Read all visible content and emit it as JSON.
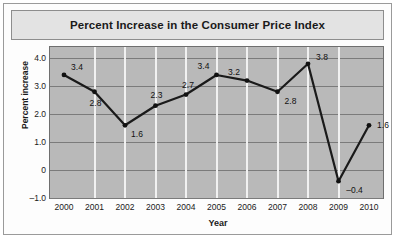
{
  "chart_data": {
    "type": "line",
    "title": "Percent Increase in the Consumer Price Index",
    "xlabel": "Year",
    "ylabel": "Percent increase",
    "categories": [
      "2000",
      "2001",
      "2002",
      "2003",
      "2004",
      "2005",
      "2006",
      "2007",
      "2008",
      "2009",
      "2010"
    ],
    "values": [
      3.4,
      2.8,
      1.6,
      2.3,
      2.7,
      3.4,
      3.2,
      2.8,
      3.8,
      -0.4,
      1.6
    ],
    "point_labels": [
      "3.4",
      "2.8",
      "1.6",
      "2.3",
      "2.7",
      "3.4",
      "3.2",
      "2.8",
      "3.8",
      "–0.4",
      "1.6"
    ],
    "ylim": [
      -1.0,
      4.4
    ],
    "yticks": [
      4.0,
      3.0,
      2.0,
      1.0,
      0,
      -1.0
    ],
    "ytick_labels": [
      "4.0",
      "3.0",
      "2.0",
      "1.0",
      "0",
      "–1.0"
    ],
    "grid": true,
    "legend": "none",
    "colors": {
      "line": "#1a1a1a",
      "plot_background": "#b9b9b9",
      "horizontal_gridline": "#7b7b7b",
      "vertical_gridline": "#f1f1f1",
      "title_background": "#e3e3e3",
      "card_background": "#fdfdfd"
    }
  }
}
